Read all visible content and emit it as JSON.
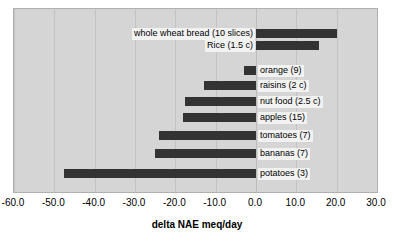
{
  "chart_data": {
    "type": "bar",
    "orientation": "horizontal",
    "title": "",
    "xlabel": "delta NAE meq/day",
    "ylabel": "",
    "xlim": [
      -60.0,
      30.0
    ],
    "xticks": [
      "-60.0",
      "-50.0",
      "-40.0",
      "-30.0",
      "-20.0",
      "-10.0",
      "0.0",
      "10.0",
      "20.0",
      "30.0"
    ],
    "xtick_values": [
      -60,
      -50,
      -40,
      -30,
      -20,
      -10,
      0,
      10,
      20,
      30
    ],
    "grid": true,
    "legend": "none",
    "bar_color": "#333333",
    "plot_background": "#d5d5d5",
    "categories": [
      "whole wheat bread (10 slices)",
      "Rice (1.5 c)",
      "",
      "orange (9)",
      "raisins (2 c)",
      "nut food (2.5 c)",
      "apples (15)",
      "tomatoes (7)",
      "bananas (7)",
      "potatoes (3)"
    ],
    "values": [
      20.0,
      15.5,
      0,
      -3.0,
      -13.0,
      -17.5,
      -18.0,
      -24.0,
      -25.0,
      -47.5
    ],
    "bars": [
      {
        "label": "whole wheat bread (10 slices)",
        "value": 20.0,
        "label_side": "left"
      },
      {
        "label": "Rice (1.5 c)",
        "value": 15.5,
        "label_side": "left"
      },
      {
        "label": "orange (9)",
        "value": -3.0,
        "label_side": "right"
      },
      {
        "label": "raisins (2 c)",
        "value": -13.0,
        "label_side": "right"
      },
      {
        "label": "nut food (2.5 c)",
        "value": -17.5,
        "label_side": "right"
      },
      {
        "label": "apples (15)",
        "value": -18.0,
        "label_side": "right"
      },
      {
        "label": "tomatoes (7)",
        "value": -24.0,
        "label_side": "right"
      },
      {
        "label": "bananas (7)",
        "value": -25.0,
        "label_side": "right"
      },
      {
        "label": "potatoes (3)",
        "value": -47.5,
        "label_side": "right"
      }
    ]
  },
  "axis": {
    "x_title": "delta NAE meq/day",
    "tick_0": "-60.0",
    "tick_1": "-50.0",
    "tick_2": "-40.0",
    "tick_3": "-30.0",
    "tick_4": "-20.0",
    "tick_5": "-10.0",
    "tick_6": "0.0",
    "tick_7": "10.0",
    "tick_8": "20.0",
    "tick_9": "30.0"
  },
  "title_fragment": ""
}
